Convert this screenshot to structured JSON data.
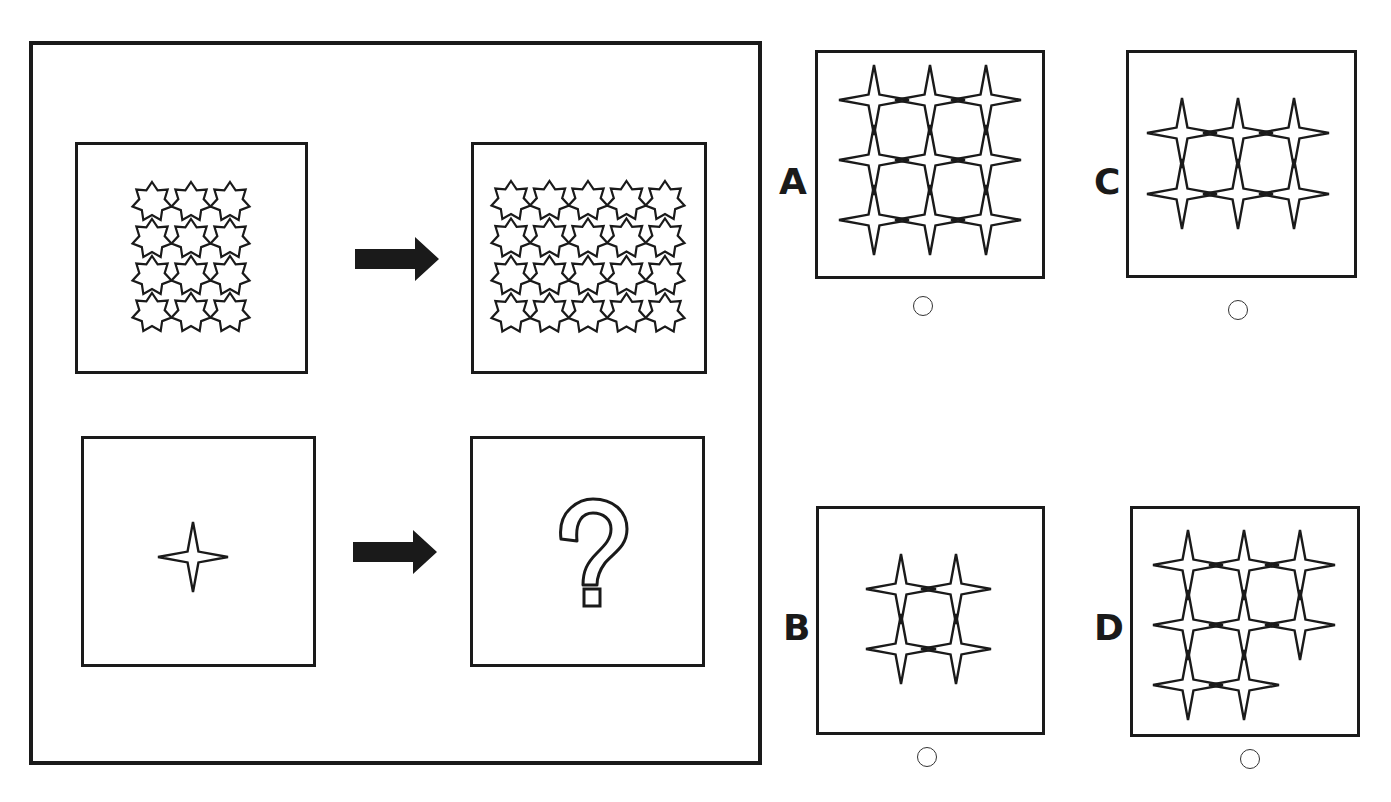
{
  "puzzle": {
    "type": "analogy",
    "question": {
      "example_input": {
        "shape": "seven-point-star",
        "cols": 3,
        "rows": 4
      },
      "example_output": {
        "shape": "seven-point-star",
        "cols": 5,
        "rows": 4
      },
      "query_input": {
        "shape": "four-point-star",
        "cols": 1,
        "rows": 1
      },
      "query_output": {
        "symbol": "?"
      }
    },
    "options": [
      {
        "label": "A",
        "shape": "four-point-star",
        "layout": "3x3 grid",
        "count": 9
      },
      {
        "label": "B",
        "shape": "four-point-star",
        "layout": "2x2 grid",
        "count": 4
      },
      {
        "label": "C",
        "shape": "four-point-star",
        "layout": "3 columns x 2 rows",
        "count": 6
      },
      {
        "label": "D",
        "shape": "four-point-star",
        "layout": "3+3+2 staircase",
        "count": 8
      }
    ]
  },
  "colors": {
    "stroke": "#1a1a1a",
    "background": "#ffffff"
  }
}
